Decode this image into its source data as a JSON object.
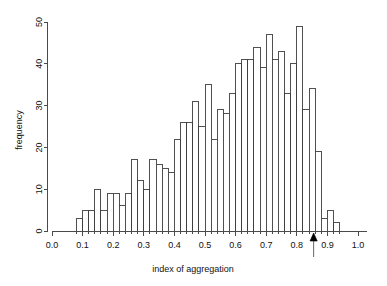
{
  "chart_data": {
    "type": "bar",
    "title": "",
    "subtitle": "",
    "xlabel": "index of aggregation",
    "ylabel": "frequency",
    "xlim": [
      0.0,
      1.0
    ],
    "ylim": [
      0,
      50
    ],
    "grid": false,
    "legend": null,
    "bin_width": 0.02,
    "x_tick_labels": [
      "0.0",
      "0.1",
      "0.2",
      "0.3",
      "0.4",
      "0.5",
      "0.6",
      "0.7",
      "0.8",
      "0.9",
      "1.0"
    ],
    "x_tick_values": [
      0.0,
      0.1,
      0.2,
      0.3,
      0.4,
      0.5,
      0.6,
      0.7,
      0.8,
      0.9,
      1.0
    ],
    "y_tick_labels": [
      "0",
      "10",
      "20",
      "30",
      "40",
      "50"
    ],
    "y_tick_values": [
      0,
      10,
      20,
      30,
      40,
      50
    ],
    "bin_starts": [
      0.08,
      0.1,
      0.12,
      0.14,
      0.16,
      0.18,
      0.2,
      0.22,
      0.24,
      0.26,
      0.28,
      0.3,
      0.32,
      0.34,
      0.36,
      0.38,
      0.4,
      0.42,
      0.44,
      0.46,
      0.48,
      0.5,
      0.52,
      0.54,
      0.56,
      0.58,
      0.6,
      0.62,
      0.64,
      0.66,
      0.68,
      0.7,
      0.72,
      0.74,
      0.76,
      0.78,
      0.8,
      0.82,
      0.84,
      0.86,
      0.88,
      0.9,
      0.92
    ],
    "categories": [
      "0.08",
      "0.10",
      "0.12",
      "0.14",
      "0.16",
      "0.18",
      "0.20",
      "0.22",
      "0.24",
      "0.26",
      "0.28",
      "0.30",
      "0.32",
      "0.34",
      "0.36",
      "0.38",
      "0.40",
      "0.42",
      "0.44",
      "0.46",
      "0.48",
      "0.50",
      "0.52",
      "0.54",
      "0.56",
      "0.58",
      "0.60",
      "0.62",
      "0.64",
      "0.66",
      "0.68",
      "0.70",
      "0.72",
      "0.74",
      "0.76",
      "0.78",
      "0.80",
      "0.82",
      "0.84",
      "0.86",
      "0.88",
      "0.90",
      "0.92"
    ],
    "values": [
      3,
      5,
      5,
      10,
      5,
      9,
      9,
      6,
      9,
      17,
      12,
      10,
      17,
      16,
      15,
      14,
      22,
      26,
      26,
      31,
      25,
      35,
      22,
      29,
      28,
      33,
      40,
      41,
      41,
      44,
      39,
      47,
      41,
      43,
      33,
      40,
      49,
      29,
      34,
      19,
      3,
      5,
      2
    ],
    "annotations": [
      {
        "name": "arrow-marker",
        "type": "arrow-up",
        "x": 0.855,
        "y": 0,
        "label": ""
      }
    ]
  },
  "axes": {
    "y_axis_label": "frequency",
    "x_axis_label": "index of aggregation"
  },
  "colors": {
    "bar_fill": "#ffffff",
    "bar_stroke": "#3d3d3d",
    "axis": "#4a4a4a",
    "text": "#111111",
    "marker": "#000000",
    "background": "#ffffff"
  }
}
